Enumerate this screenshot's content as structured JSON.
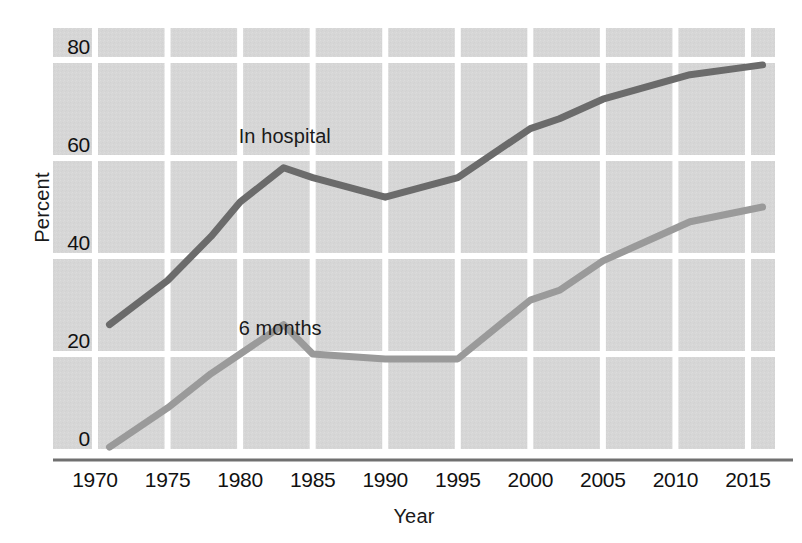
{
  "chart_data": {
    "type": "line",
    "title": "",
    "xlabel": "Year",
    "ylabel": "Percent",
    "xlim": [
      1970,
      2016
    ],
    "ylim": [
      0,
      85
    ],
    "grid": true,
    "legend_position": "inline-annotation",
    "x_ticks": [
      "1970",
      "1975",
      "1980",
      "1985",
      "1990",
      "1995",
      "2000",
      "2005",
      "2010",
      "2015"
    ],
    "y_ticks": [
      "0",
      "20",
      "40",
      "60",
      "80"
    ],
    "series": [
      {
        "name": "In hospital",
        "color": "#6b6b6b",
        "label_x": 1983,
        "label_y": 64,
        "x": [
          1971,
          1975,
          1978,
          1980,
          1983,
          1985,
          1990,
          1995,
          2000,
          2002,
          2005,
          2011,
          2016
        ],
        "values": [
          26,
          35,
          44,
          51,
          58,
          56,
          52,
          56,
          66,
          68,
          72,
          77,
          79
        ]
      },
      {
        "name": "6 months",
        "color": "#9a9a9a",
        "label_x": 1983,
        "label_y": 25,
        "x": [
          1971,
          1975,
          1978,
          1980,
          1983,
          1985,
          1990,
          1995,
          2000,
          2002,
          2005,
          2011,
          2016
        ],
        "values": [
          1,
          9,
          16,
          20,
          26,
          20,
          19,
          19,
          31,
          33,
          39,
          47,
          50
        ]
      }
    ]
  },
  "colors": {
    "plot_background": "#d6d6d6",
    "gridline": "#ffffff",
    "axis_line": "#707070",
    "text": "#111111",
    "series_dark": "#6b6b6b",
    "series_light": "#9a9a9a"
  },
  "axes": {
    "y_title": "Percent",
    "x_title": "Year"
  },
  "annotations": {
    "in_hospital": "In hospital",
    "six_months": "6 months"
  }
}
